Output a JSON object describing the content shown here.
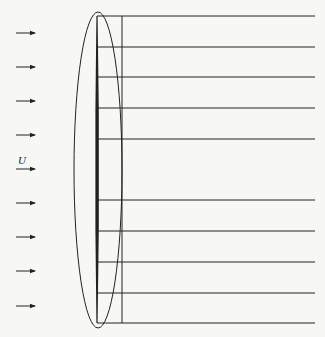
{
  "diagram": {
    "free_stream_label": "U",
    "colors": {
      "ink": "#222222",
      "background": "#f7f7f5"
    },
    "arrows_y": [
      33,
      67,
      101,
      135,
      169,
      203,
      237,
      271,
      306
    ],
    "arrow_x_start": 16,
    "arrow_x_end": 35,
    "label_arrow_index": 4,
    "plate": {
      "x": 97,
      "y_top": 16,
      "y_bottom": 323
    },
    "inner_vertical_x": 122,
    "horizontal_lines_y": [
      16,
      47,
      77,
      108,
      139,
      200,
      231,
      262,
      293,
      323
    ],
    "lines_x_end": 315,
    "ellipse": {
      "cx": 98,
      "cy": 170,
      "rx": 24,
      "ry": 158
    }
  }
}
